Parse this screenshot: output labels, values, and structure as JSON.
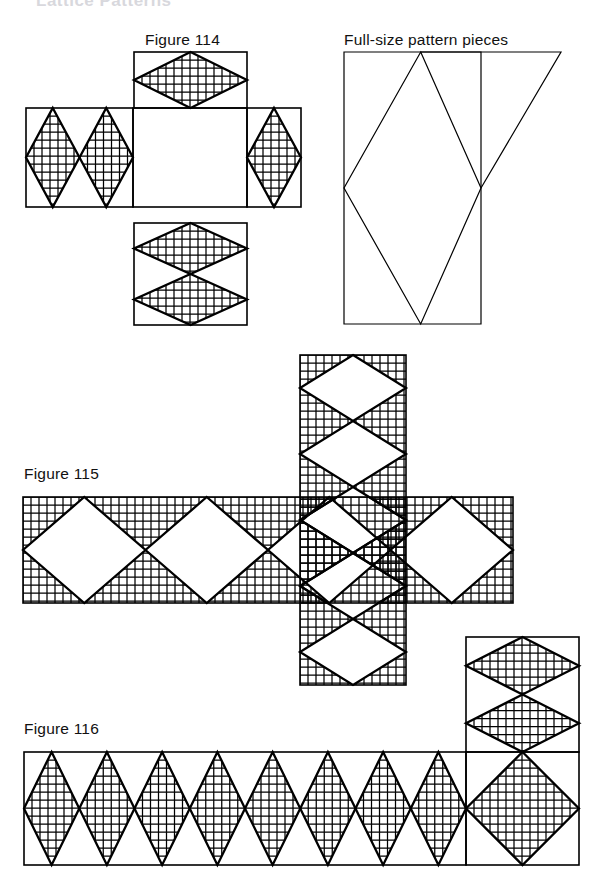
{
  "page": {
    "width": 597,
    "height": 894,
    "background": "#ffffff",
    "ink": "#000000",
    "clipped_header_text": "Lattice Patterns"
  },
  "labels": {
    "figure_114": "Figure 114",
    "full_size_pattern": "Full-size pattern pieces",
    "figure_115": "Figure 115",
    "figure_116": "Figure 116"
  },
  "figures": [
    {
      "id": "figure-114",
      "caption": "Figure 114",
      "layout": "cross-net",
      "fill_style": "hatched-diamonds-on-white",
      "panels": [
        {
          "name": "top-panel",
          "x": 134,
          "y": 52,
          "w": 113,
          "h": 56,
          "diamonds": 1,
          "orientation": "wide"
        },
        {
          "name": "left-panel",
          "x": 26,
          "y": 108,
          "w": 107,
          "h": 99,
          "diamonds": 2,
          "orientation": "tall"
        },
        {
          "name": "center-panel",
          "x": 133,
          "y": 108,
          "w": 114,
          "h": 99,
          "diamonds": 0,
          "orientation": "blank"
        },
        {
          "name": "right-panel",
          "x": 247,
          "y": 108,
          "w": 54,
          "h": 99,
          "diamonds": 1,
          "orientation": "tall"
        },
        {
          "name": "bottom-panel",
          "x": 134,
          "y": 223,
          "w": 113,
          "h": 102,
          "diamonds": 2,
          "orientation": "wide"
        }
      ]
    },
    {
      "id": "full-size-pattern",
      "caption": "Full-size pattern pieces",
      "layout": "rectangle-with-diamond-and-triangle",
      "fill_style": "outline-only",
      "rect": {
        "x": 344,
        "y": 52,
        "w": 137,
        "h": 272
      },
      "triangle_apex_x": 561
    },
    {
      "id": "figure-115",
      "caption": "Figure 115",
      "layout": "t-net",
      "fill_style": "white-diamonds-on-hatched",
      "panels": [
        {
          "name": "horizontal-strip",
          "x": 23,
          "y": 497,
          "w": 490,
          "h": 106,
          "diamonds": 4,
          "orientation": "wide"
        },
        {
          "name": "vertical-strip",
          "x": 300,
          "y": 355,
          "w": 106,
          "h": 330,
          "diamonds": 5,
          "orientation": "tall"
        }
      ]
    },
    {
      "id": "figure-116",
      "caption": "Figure 116",
      "layout": "l-net",
      "fill_style": "hatched-diamonds-on-white",
      "panels": [
        {
          "name": "horizontal-strip",
          "x": 24,
          "y": 752,
          "w": 442,
          "h": 113,
          "diamonds": 8,
          "orientation": "tall"
        },
        {
          "name": "corner-square",
          "x": 466,
          "y": 752,
          "w": 113,
          "h": 113,
          "diamonds": 1,
          "orientation": "square"
        },
        {
          "name": "upper-stack",
          "x": 466,
          "y": 637,
          "w": 113,
          "h": 115,
          "diamonds": 2,
          "orientation": "wide"
        }
      ]
    }
  ],
  "geometry_notes": {
    "hatch_spacing_px": 8,
    "hatch_directions": [
      "horizontal",
      "vertical"
    ],
    "outline_stroke_px": 2.3,
    "frame_stroke_px": 1.6
  }
}
